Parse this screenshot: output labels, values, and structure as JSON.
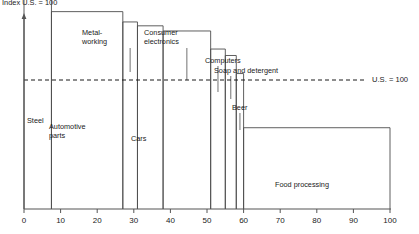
{
  "chart_data": {
    "type": "bar",
    "title": "Index U.S. = 100",
    "subtitle": "",
    "xlabel": "",
    "ylabel": "",
    "xlim": [
      0,
      100
    ],
    "ylim": [
      0,
      185
    ],
    "grid": false,
    "legend": "none",
    "variable_width": true,
    "x_ticks": [
      "0",
      "10",
      "20",
      "30",
      "40",
      "50",
      "60",
      "70",
      "80",
      "90",
      "100"
    ],
    "x_tick_values": [
      0,
      10,
      20,
      30,
      40,
      50,
      60,
      70,
      80,
      90,
      100
    ],
    "reference_line": {
      "value": 100,
      "label": "U.S. = 100",
      "style": "dashed"
    },
    "categories": [
      "Steel",
      "Automotive parts",
      "Metal-working",
      "Cars",
      "Consumer electronics",
      "Computers",
      "Soap and detergent",
      "Beer",
      "Food processing"
    ],
    "bars": [
      {
        "label": "Steel",
        "x_start": 0,
        "x_end": 7.5,
        "value": 176,
        "label_placement": "inside",
        "label_text": "Steel"
      },
      {
        "label": "Automotive parts",
        "x_start": 7.5,
        "x_end": 27,
        "value": 153,
        "label_placement": "inside",
        "label_text": "Automotive\nparts"
      },
      {
        "label": "Metal-working",
        "x_start": 27,
        "x_end": 31,
        "value": 145,
        "label_placement": "outside",
        "label_text": "Metal-\nworking"
      },
      {
        "label": "Cars",
        "x_start": 31,
        "x_end": 38,
        "value": 142,
        "label_placement": "inside",
        "label_text": "Cars"
      },
      {
        "label": "Consumer electronics",
        "x_start": 38,
        "x_end": 51,
        "value": 138,
        "label_placement": "outside",
        "label_text": "Consumer\nelectronics"
      },
      {
        "label": "Computers",
        "x_start": 51,
        "x_end": 55,
        "value": 124,
        "label_placement": "outside",
        "label_text": "Computers"
      },
      {
        "label": "Soap and detergent",
        "x_start": 55,
        "x_end": 58,
        "value": 119,
        "label_placement": "outside",
        "label_text": "Soap and detergent"
      },
      {
        "label": "Beer",
        "x_start": 58,
        "x_end": 60,
        "value": 105,
        "label_placement": "outside",
        "label_text": "Beer"
      },
      {
        "label": "Food processing",
        "x_start": 60,
        "x_end": 100,
        "value": 63,
        "label_placement": "inside",
        "label_text": "Food processing"
      }
    ],
    "annotations": [
      {
        "text": "Index U.S. = 100",
        "position": "top-left"
      },
      {
        "text": "U.S. = 100",
        "position": "right-of-dashed-line"
      }
    ]
  }
}
